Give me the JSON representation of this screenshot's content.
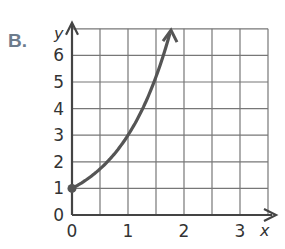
{
  "problem_label": "B.",
  "chart_data": {
    "type": "line",
    "title": "",
    "xlabel": "x",
    "ylabel": "y",
    "xlim": [
      0,
      3.5
    ],
    "ylim": [
      0,
      7
    ],
    "x_ticks": [
      "0",
      "1",
      "2",
      "3"
    ],
    "y_ticks": [
      "0",
      "1",
      "2",
      "3",
      "4",
      "5",
      "6"
    ],
    "grid": true,
    "grid_x_step": 0.5,
    "grid_y_step": 1,
    "series": [
      {
        "name": "y = 3^x",
        "x": [
          0,
          0.25,
          0.5,
          0.75,
          1,
          1.25,
          1.5,
          1.75
        ],
        "y": [
          1,
          1.32,
          1.73,
          2.28,
          3,
          3.95,
          5.2,
          6.84
        ],
        "start_point": [
          0,
          1
        ],
        "arrow_end": true,
        "color": "#555555"
      }
    ]
  }
}
